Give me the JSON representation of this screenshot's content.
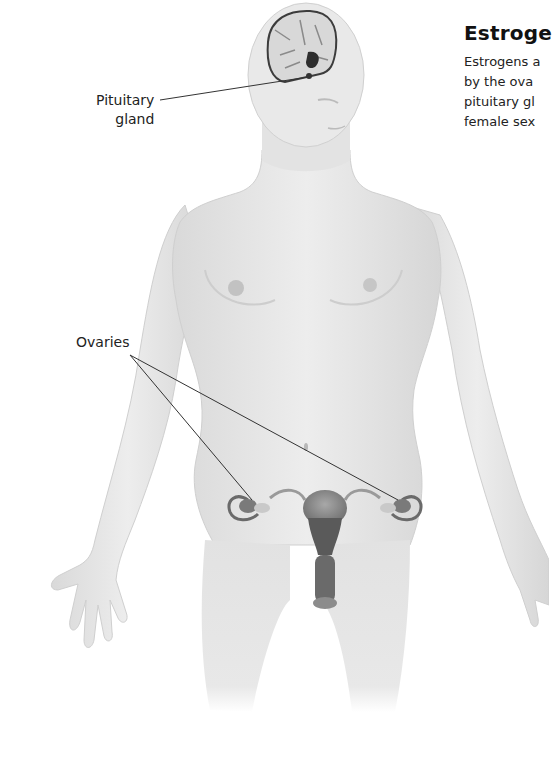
{
  "article": {
    "heading": "Estroge",
    "body_lines": [
      "Estrogens a",
      "by the ova",
      "pituitary gl",
      "female sex"
    ]
  },
  "figure": {
    "labels": {
      "pituitary_line1": "Pituitary",
      "pituitary_line2": "gland",
      "ovaries": "Ovaries"
    },
    "colors": {
      "skin": "#e6e6e6",
      "skin_shadow": "#cfcfcf",
      "organ": "#8a8a8a",
      "organ_dark": "#555555",
      "leader_line": "#333333"
    }
  }
}
